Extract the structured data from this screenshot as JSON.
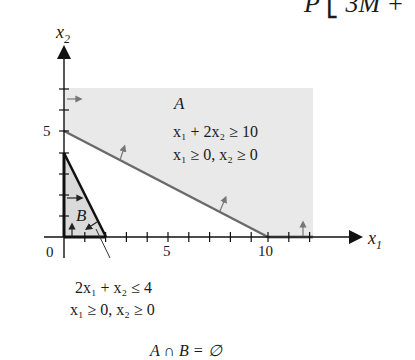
{
  "header_fragment": "P ⎣ 3M +",
  "axes": {
    "x_label": "x",
    "x_sub": "1",
    "y_label": "x",
    "y_sub": "2",
    "origin_label": "0",
    "x_tick_labels": [
      "5",
      "10"
    ],
    "y_tick_labels": [
      "5"
    ]
  },
  "region_a": {
    "name": "A",
    "constraint_1": "x₁ + 2x₂ ≥ 10",
    "constraint_2": "x₁ ≥ 0, x₂ ≥ 0",
    "fill": "#e8e8e8",
    "boundary_color": "#6a6a6a"
  },
  "region_b": {
    "name": "B",
    "constraint_1": "2x₁ + x₂ ≤ 4",
    "constraint_2": "x₁ ≥ 0, x₂ ≥ 0",
    "fill": "#dcdcdc",
    "boundary_color": "#1a1a1a"
  },
  "conclusion": "A ∩ B = ∅"
}
